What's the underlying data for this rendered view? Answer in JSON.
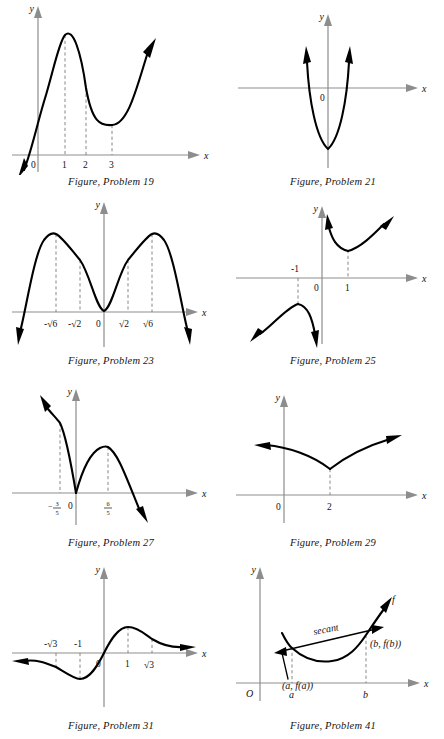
{
  "page": {
    "background_color": "#ffffff",
    "axis_color": "#8d8d8d",
    "curve_color": "#000000",
    "dash_color": "#7a7a7a",
    "figure_count": 8
  },
  "figures": [
    {
      "id": "problem-19",
      "caption": "Figure, Problem 19",
      "axis_x_label": "x",
      "axis_y_label": "y",
      "origin_label": "0",
      "tick_labels": [
        "1",
        "2",
        "3"
      ],
      "dashed_at": [
        "1",
        "2",
        "3"
      ],
      "description": "cubic rising through origin, local max at x=1, local min at x=3"
    },
    {
      "id": "problem-21",
      "caption": "Figure, Problem 21",
      "axis_x_label": "x",
      "axis_y_label": "y",
      "origin_label": "0",
      "tick_labels": [],
      "dashed_at": [],
      "description": "narrow upward parabola with vertex below the x-axis on the y-axis"
    },
    {
      "id": "problem-23",
      "caption": "Figure, Problem 23",
      "axis_x_label": "x",
      "axis_y_label": "y",
      "origin_label": "0",
      "tick_labels": [
        "-√6",
        "-√2",
        "√2",
        "√6"
      ],
      "dashed_at": [
        "-√6",
        "-√2",
        "√2",
        "√6"
      ],
      "description": "W-shaped quartic touching zero at origin with maxima at plus or minus root 6"
    },
    {
      "id": "problem-25",
      "caption": "Figure, Problem 25",
      "axis_x_label": "x",
      "axis_y_label": "y",
      "origin_label": "0",
      "tick_labels": [
        "-1",
        "1"
      ],
      "dashed_at": [
        "-1",
        "1"
      ],
      "description": "two branches with vertical asymptote at x = 0, minimum at x = 1, maximum at x = -1"
    },
    {
      "id": "problem-27",
      "caption": "Figure, Problem 27",
      "axis_x_label": "x",
      "axis_y_label": "y",
      "origin_label": "0",
      "tick_labels": [
        "-3/5",
        "6/5"
      ],
      "tick_fractions": [
        {
          "sign": "−",
          "numerator": "3",
          "denominator": "5"
        },
        {
          "sign": "",
          "numerator": "6",
          "denominator": "5"
        }
      ],
      "dashed_at": [
        "-3/5",
        "6/5"
      ],
      "description": "cusp at origin, left branch rising steeply, right hump peaking at 6/5 then falling"
    },
    {
      "id": "problem-29",
      "caption": "Figure, Problem 29",
      "axis_x_label": "x",
      "axis_y_label": "y",
      "origin_label": "0",
      "tick_labels": [
        "2"
      ],
      "dashed_at": [
        "2"
      ],
      "description": "cusp minimum at x = 2 with both branches rising outward"
    },
    {
      "id": "problem-31",
      "caption": "Figure, Problem 31",
      "axis_x_label": "x",
      "axis_y_label": "y",
      "origin_label": "0",
      "tick_labels": [
        "-√3",
        "-1",
        "1",
        "√3"
      ],
      "dashed_at": [
        "-√3",
        "-1",
        "1",
        "√3"
      ],
      "description": "odd S-shaped curve through origin, minimum at x = -1, maximum at x = 1"
    },
    {
      "id": "problem-41",
      "caption": "Figure, Problem 41",
      "axis_x_label": "x",
      "axis_y_label": "y",
      "origin_label": "O",
      "tick_labels": [
        "a",
        "b"
      ],
      "dashed_at": [
        "a",
        "b"
      ],
      "curve_label": "f",
      "secant_label": "secant",
      "point_label_a": "(a, f(a))",
      "point_label_b": "(b, f(b))",
      "description": "convex curve f with a secant line joining the points (a,f(a)) and (b,f(b))"
    }
  ],
  "bottom_artifact": {
    "text": ""
  }
}
